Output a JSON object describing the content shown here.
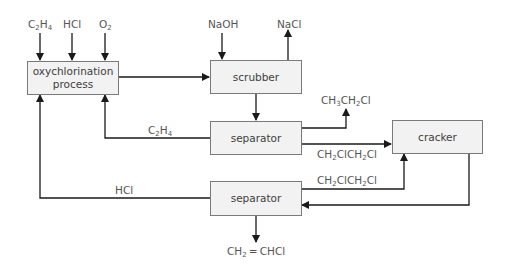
{
  "diagram": {
    "type": "process-flow",
    "nodes": [
      {
        "id": "oxychlorination",
        "label_line1": "oxychlorination",
        "label_line2": "process"
      },
      {
        "id": "scrubber",
        "label": "scrubber"
      },
      {
        "id": "separator1",
        "label": "separator"
      },
      {
        "id": "cracker",
        "label": "cracker"
      },
      {
        "id": "separator2",
        "label": "separator"
      }
    ],
    "inputs": {
      "c2h4": {
        "main": "C",
        "s1": "2",
        "mid": "H",
        "s2": "4"
      },
      "hcl": "HCl",
      "o2": {
        "main": "O",
        "s1": "2"
      },
      "naoh": "NaOH"
    },
    "outputs": {
      "nacl": "NaCl",
      "chloroethane": {
        "a": "CH",
        "s1": "3",
        "b": "CH",
        "s2": "2",
        "c": "Cl"
      },
      "vinyl_chloride": {
        "a": "CH",
        "s1": "2",
        "b": " ═ CHCl"
      }
    },
    "edge_labels": {
      "recycle_c2h4": {
        "main": "C",
        "s1": "2",
        "mid": "H",
        "s2": "4"
      },
      "recycle_hcl": "HCl",
      "dce_to_cracker": {
        "a": "CH",
        "s1": "2",
        "b": "ClCH",
        "s2": "2",
        "c": "Cl"
      },
      "dce_recycle": {
        "a": "CH",
        "s1": "2",
        "b": "ClCH",
        "s2": "2",
        "c": "Cl"
      }
    },
    "edges": [
      {
        "from": "C2H4 feed",
        "to": "oxychlorination"
      },
      {
        "from": "HCl feed",
        "to": "oxychlorination"
      },
      {
        "from": "O2 feed",
        "to": "oxychlorination"
      },
      {
        "from": "oxychlorination",
        "to": "scrubber"
      },
      {
        "from": "NaOH feed",
        "to": "scrubber"
      },
      {
        "from": "scrubber",
        "to": "NaCl out"
      },
      {
        "from": "scrubber",
        "to": "separator1"
      },
      {
        "from": "separator1",
        "to": "CH3CH2Cl out"
      },
      {
        "from": "separator1",
        "to": "cracker",
        "label": "CH2ClCH2Cl"
      },
      {
        "from": "separator1",
        "to": "oxychlorination",
        "label": "C2H4"
      },
      {
        "from": "cracker",
        "to": "separator2"
      },
      {
        "from": "separator2",
        "to": "cracker",
        "label": "CH2ClCH2Cl"
      },
      {
        "from": "separator2",
        "to": "oxychlorination",
        "label": "HCl"
      },
      {
        "from": "separator2",
        "to": "CH2=CHCl out"
      }
    ],
    "colors": {
      "line": "#1a1a1a",
      "box_fill": "#f2f2f2",
      "box_border": "#7a7a7a",
      "text": "#4a4a4a"
    }
  }
}
